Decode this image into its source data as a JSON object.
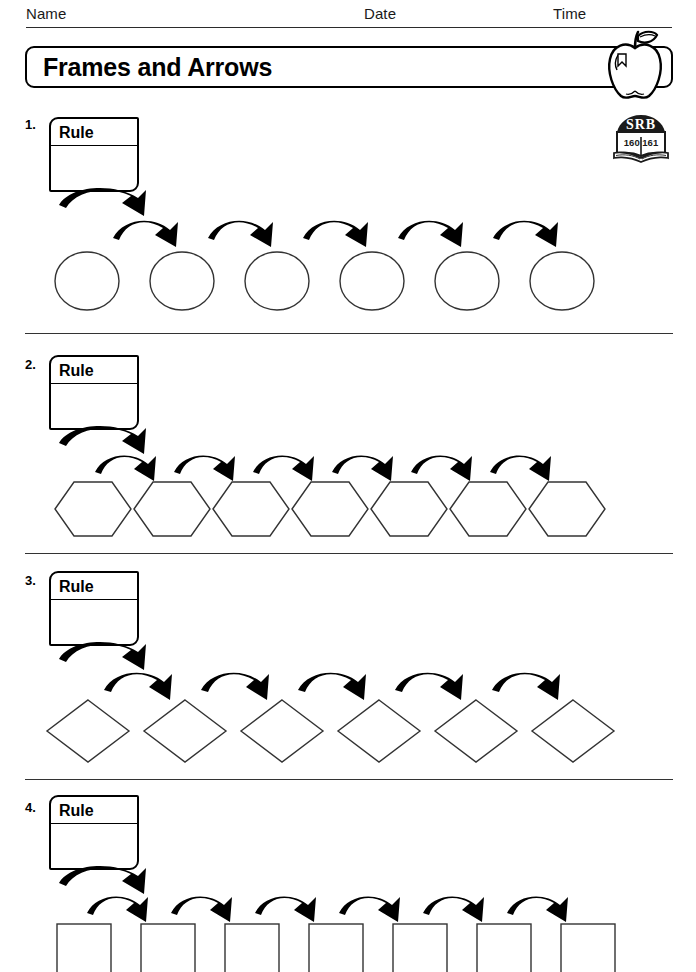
{
  "header": {
    "name_label": "Name",
    "date_label": "Date",
    "time_label": "Time"
  },
  "title": {
    "text": "Frames and Arrows",
    "decoration_icon": "apple-icon"
  },
  "reference_badge": {
    "book_icon": "srb-book-icon",
    "label": "SRB",
    "pages": "160  161"
  },
  "problems": [
    {
      "number": "1.",
      "rule_label": "Rule",
      "rule_value": "",
      "shape": "circle",
      "shape_count": 6,
      "arrow_count": 5
    },
    {
      "number": "2.",
      "rule_label": "Rule",
      "rule_value": "",
      "shape": "hexagon",
      "shape_count": 7,
      "arrow_count": 6
    },
    {
      "number": "3.",
      "rule_label": "Rule",
      "rule_value": "",
      "shape": "diamond",
      "shape_count": 6,
      "arrow_count": 5
    },
    {
      "number": "4.",
      "rule_label": "Rule",
      "rule_value": "",
      "shape": "square",
      "shape_count": 7,
      "arrow_count": 6
    }
  ]
}
